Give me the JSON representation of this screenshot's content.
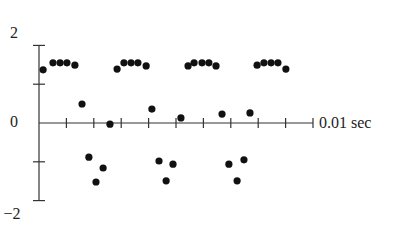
{
  "chart_data": {
    "type": "scatter",
    "title": "",
    "xlabel": "0.01 sec",
    "ylabel": "",
    "xlim": [
      0,
      10
    ],
    "ylim": [
      -2,
      2
    ],
    "x_unit": "ms",
    "x_ticks": [
      1,
      2,
      3,
      4,
      5,
      6,
      7,
      8,
      9,
      10
    ],
    "y_ticks": [
      -2,
      -1,
      0,
      1,
      2
    ],
    "y_tick_labels": [
      {
        "value": 2,
        "label": "2"
      },
      {
        "value": 0,
        "label": "0"
      },
      {
        "value": -2,
        "label": "−2"
      }
    ],
    "grid": false,
    "legend": null,
    "series": [
      {
        "name": "samples",
        "color": "#111111",
        "points": [
          [
            0.15,
            1.37
          ],
          [
            0.51,
            1.55
          ],
          [
            0.77,
            1.55
          ],
          [
            1.02,
            1.55
          ],
          [
            1.31,
            1.49
          ],
          [
            1.57,
            0.49
          ],
          [
            1.82,
            -0.88
          ],
          [
            2.08,
            -1.52
          ],
          [
            2.34,
            -1.16
          ],
          [
            2.59,
            -0.03
          ],
          [
            2.85,
            1.39
          ],
          [
            3.1,
            1.55
          ],
          [
            3.36,
            1.55
          ],
          [
            3.61,
            1.55
          ],
          [
            3.91,
            1.47
          ],
          [
            4.12,
            0.36
          ],
          [
            4.38,
            -0.98
          ],
          [
            4.64,
            -1.49
          ],
          [
            4.89,
            -1.06
          ],
          [
            5.18,
            0.13
          ],
          [
            5.44,
            1.47
          ],
          [
            5.66,
            1.55
          ],
          [
            5.95,
            1.55
          ],
          [
            6.2,
            1.55
          ],
          [
            6.46,
            1.47
          ],
          [
            6.68,
            0.23
          ],
          [
            6.93,
            -1.06
          ],
          [
            7.23,
            -1.49
          ],
          [
            7.48,
            -0.95
          ],
          [
            7.7,
            0.26
          ],
          [
            7.96,
            1.49
          ],
          [
            8.21,
            1.55
          ],
          [
            8.47,
            1.55
          ],
          [
            8.72,
            1.55
          ],
          [
            9.01,
            1.39
          ]
        ]
      }
    ]
  },
  "labels": {
    "y_top": "2",
    "y_zero": "0",
    "y_bottom": "−2",
    "x_axis": "0.01 sec"
  }
}
